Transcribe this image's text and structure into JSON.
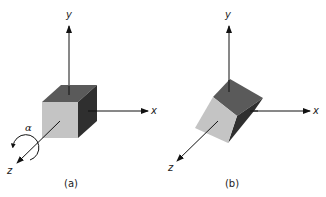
{
  "figure": {
    "panels": [
      {
        "id": "a",
        "caption": "(a)",
        "axes": {
          "x": "x",
          "y": "y",
          "z": "z"
        },
        "rotation_label": "α",
        "rotation_axis": "z",
        "object": "cube (unrotated)"
      },
      {
        "id": "b",
        "caption": "(b)",
        "axes": {
          "x": "x",
          "y": "y",
          "z": "z"
        },
        "object": "cube (rotated about z by α)"
      }
    ],
    "colors": {
      "top_face": "#5a5a5a",
      "front_face": "#c4c4c4",
      "side_face": "#2f2f2f",
      "axis": "#111111"
    }
  }
}
